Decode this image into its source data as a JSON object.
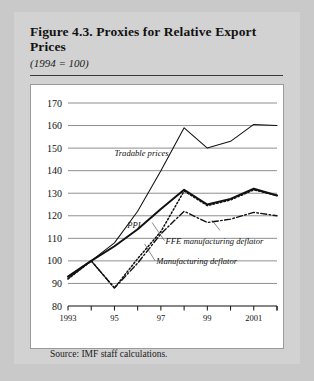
{
  "figure": {
    "title": "Figure 4.3. Proxies for Relative Export Prices",
    "subtitle": "(1994 = 100)",
    "source": "Source: IMF staff calculations."
  },
  "chart_data": {
    "type": "line",
    "title": "Figure 4.3. Proxies for Relative Export Prices",
    "subtitle": "(1994 = 100)",
    "xlabel": "",
    "ylabel": "",
    "xlim": [
      1993,
      2002
    ],
    "ylim": [
      80,
      170
    ],
    "yticks": [
      80,
      90,
      100,
      110,
      120,
      130,
      140,
      150,
      160,
      170
    ],
    "xticks": [
      1993,
      1994,
      1995,
      1996,
      1997,
      1998,
      1999,
      2000,
      2001,
      2002
    ],
    "xticklabels": [
      "1993",
      "",
      "95",
      "",
      "97",
      "",
      "99",
      "",
      "2001",
      ""
    ],
    "grid": "horizontal",
    "legend": "inline-annotations",
    "x": [
      1993,
      1994,
      1995,
      1996,
      1997,
      1998,
      1999,
      2000,
      2001,
      2002
    ],
    "series": [
      {
        "name": "Tradable prices",
        "style": "solid-thin",
        "values": [
          92,
          100,
          108,
          122,
          140,
          159,
          150,
          153,
          160.5,
          160
        ]
      },
      {
        "name": "PPI",
        "style": "solid-thick",
        "values": [
          93,
          100,
          106.5,
          114,
          123,
          131.5,
          125,
          127.5,
          132,
          129
        ]
      },
      {
        "name": "FFE manufacturing deflator",
        "style": "dotted",
        "values": [
          92,
          100,
          88,
          101,
          113,
          131,
          124.5,
          127,
          131.5,
          129
        ]
      },
      {
        "name": "Manufacturing deflator",
        "style": "dash-dot",
        "values": [
          93,
          100,
          88,
          99,
          112,
          122,
          117,
          118.5,
          121.5,
          120
        ]
      }
    ],
    "annotations": [
      {
        "text": "Tradable prices",
        "x": 1995.0,
        "y": 146.5
      },
      {
        "text": "PPI",
        "x": 1995.55,
        "y": 114.5
      },
      {
        "text": "FFE manufacturing deflator",
        "x": 1997.2,
        "y": 107.5
      },
      {
        "text": "Manufacturing deflator",
        "x": 1996.8,
        "y": 98.5
      }
    ]
  }
}
